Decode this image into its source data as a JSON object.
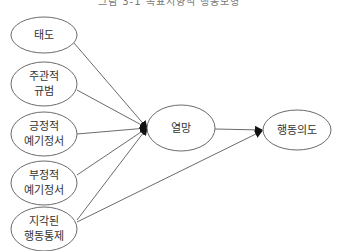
{
  "title": "그림 3-1 목표지향적 행동모형",
  "nodes": [
    {
      "id": "attitude",
      "lines": [
        "태도"
      ],
      "cx": 44,
      "cy": 35,
      "rx": 33,
      "ry": 18
    },
    {
      "id": "subjective_norm",
      "lines": [
        "주관적",
        "규범"
      ],
      "cx": 44,
      "cy": 84,
      "rx": 33,
      "ry": 22
    },
    {
      "id": "positive_anticipated_emotion",
      "lines": [
        "긍정적",
        "예기정서"
      ],
      "cx": 44,
      "cy": 134,
      "rx": 33,
      "ry": 22
    },
    {
      "id": "negative_anticipated_emotion",
      "lines": [
        "부정적",
        "예기정서"
      ],
      "cx": 44,
      "cy": 183,
      "rx": 33,
      "ry": 22
    },
    {
      "id": "perceived_behavioral_control",
      "lines": [
        "지각된",
        "행동통제"
      ],
      "cx": 44,
      "cy": 229,
      "rx": 33,
      "ry": 22
    },
    {
      "id": "desire",
      "lines": [
        "열망"
      ],
      "cx": 181,
      "cy": 128,
      "rx": 34,
      "ry": 23
    },
    {
      "id": "behavioral_intention",
      "lines": [
        "행동의도"
      ],
      "cx": 297,
      "cy": 130,
      "rx": 34,
      "ry": 20
    }
  ],
  "edges": [
    {
      "from": "attitude",
      "to": "desire",
      "x1": 74,
      "y1": 43,
      "x2": 147,
      "y2": 128
    },
    {
      "from": "subjective_norm",
      "to": "desire",
      "x1": 77,
      "y1": 90,
      "x2": 147,
      "y2": 128
    },
    {
      "from": "positive_anticipated_emotion",
      "to": "desire",
      "x1": 77,
      "y1": 134,
      "x2": 147,
      "y2": 128
    },
    {
      "from": "negative_anticipated_emotion",
      "to": "desire",
      "x1": 77,
      "y1": 175,
      "x2": 147,
      "y2": 128
    },
    {
      "from": "perceived_behavioral_control",
      "to": "desire",
      "x1": 77,
      "y1": 220,
      "x2": 147,
      "y2": 128
    },
    {
      "from": "desire",
      "to": "behavioral_intention",
      "x1": 215,
      "y1": 129,
      "x2": 262,
      "y2": 130
    },
    {
      "from": "perceived_behavioral_control",
      "to": "behavioral_intention",
      "x1": 77,
      "y1": 222,
      "x2": 262,
      "y2": 131
    }
  ],
  "colors": {
    "stroke": "#6b6b6b",
    "arrow": "#111111",
    "text": "#333333"
  }
}
